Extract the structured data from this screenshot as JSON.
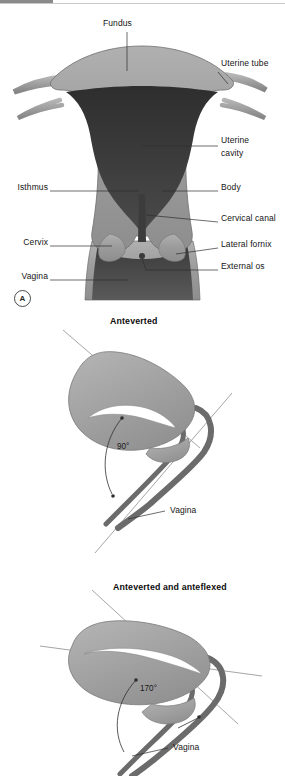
{
  "figure": {
    "background_color": "#ffffff",
    "accent_bar_color": "#8a8a8a",
    "wall_color": "#9a9a9a",
    "cavity_color": "#3a3a3a",
    "tube_color": "#777777",
    "leader_color": "#303030"
  },
  "panel_a": {
    "letter": "A",
    "labels": {
      "fundus": "Fundus",
      "uterine_tube": "Uterine tube",
      "uterine_cavity_line1": "Uterine",
      "uterine_cavity_line2": "cavity",
      "isthmus": "Isthmus",
      "body": "Body",
      "cervical_canal": "Cervical canal",
      "cervix": "Cervix",
      "lateral_fornix": "Lateral fornix",
      "external_os": "External os",
      "vagina": "Vagina"
    }
  },
  "panel_b": {
    "title": "Anteverted",
    "angle": "90°",
    "labels": {
      "vagina": "Vagina"
    }
  },
  "panel_c": {
    "title": "Anteverted and anteflexed",
    "angle": "170°",
    "labels": {
      "vagina": "Vagina"
    }
  }
}
